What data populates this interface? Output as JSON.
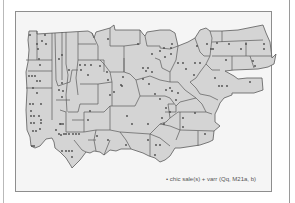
{
  "figure": {
    "type": "dot-distribution map",
    "legend": {
      "marker": "•",
      "text": "chic sale(s) + varr (Qq, M21a, b)"
    },
    "colors": {
      "land_fill": "#d4d4d4",
      "border": "#5a5a5a",
      "dot": "#4a4a4a",
      "frame_bg": "#f5f5f5",
      "frame_border": "#8e8e8e"
    }
  }
}
